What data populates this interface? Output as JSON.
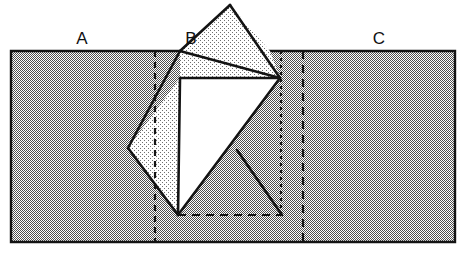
{
  "figure": {
    "canvas": {
      "width": 469,
      "height": 256,
      "background": "#ffffff"
    },
    "labels": [
      {
        "id": "A",
        "text": "A",
        "x": 82,
        "y": 44
      },
      {
        "id": "B",
        "text": "B",
        "x": 191,
        "y": 44
      },
      {
        "id": "C",
        "text": "C",
        "x": 379,
        "y": 44
      }
    ],
    "colors": {
      "strip_fill": "#9b9b9b",
      "flap_fill": "#cfcfcf",
      "white_fill": "#ffffff",
      "outline": "#141414",
      "label_color": "#111111",
      "dash_color": "#141414"
    },
    "strip": {
      "name": "background-rectangle",
      "points": "11,51 455,51 455,242 11,242",
      "top_y": 51,
      "bottom_y": 242,
      "left_x": 11,
      "right_x": 455
    },
    "square": {
      "name": "rotated-square",
      "vertices": {
        "top": {
          "x": 180,
          "y": 51
        },
        "right": {
          "x": 280,
          "y": 78
        },
        "bottom": {
          "x": 178,
          "y": 215
        },
        "left": {
          "x": 128,
          "y": 148
        }
      }
    },
    "shapes": {
      "top_triangle": {
        "name": "upper-flap-triangle",
        "points": "180,51 230,5 270,51",
        "fill": "flap_fill"
      },
      "upper_band": {
        "name": "upper-band-quad",
        "points": "180,51 270,51 280,78 180,78",
        "fill": "flap_fill"
      },
      "left_flap": {
        "name": "left-flap-polygon",
        "points": "180,78 180,215 128,148",
        "fill": "flap_fill"
      },
      "white_core": {
        "name": "white-inner-polygon",
        "points": "180,78 280,78 178,215",
        "fill": "white_fill"
      }
    },
    "lines": {
      "solid": [
        {
          "name": "square-edge-top-left",
          "x1": 180,
          "y1": 51,
          "x2": 128,
          "y2": 148
        },
        {
          "name": "square-edge-bottom-left",
          "x1": 128,
          "y1": 148,
          "x2": 178,
          "y2": 215
        },
        {
          "name": "square-edge-bottom-right",
          "x1": 178,
          "y1": 215,
          "x2": 280,
          "y2": 78
        },
        {
          "name": "square-edge-top-right",
          "x1": 280,
          "y1": 78,
          "x2": 180,
          "y2": 51
        },
        {
          "name": "triangle-edge-left",
          "x1": 180,
          "y1": 51,
          "x2": 230,
          "y2": 5
        },
        {
          "name": "triangle-edge-right",
          "x1": 230,
          "y1": 5,
          "x2": 280,
          "y2": 78
        },
        {
          "name": "crease-horizontal",
          "x1": 180,
          "y1": 78,
          "x2": 280,
          "y2": 78
        },
        {
          "name": "crease-vertical",
          "x1": 180,
          "y1": 78,
          "x2": 178,
          "y2": 215
        },
        {
          "name": "lower-right-flap-edge",
          "x1": 237,
          "y1": 150,
          "x2": 282,
          "y2": 215
        }
      ],
      "dashed": [
        {
          "name": "dashed-vertical-left",
          "x1": 155,
          "y1": 51,
          "x2": 155,
          "y2": 242,
          "pattern": "6,5"
        },
        {
          "name": "dashed-vertical-mid",
          "x1": 281,
          "y1": 51,
          "x2": 281,
          "y2": 215,
          "pattern": "3,4"
        },
        {
          "name": "dashed-vertical-right",
          "x1": 303,
          "y1": 51,
          "x2": 303,
          "y2": 242,
          "pattern": "8,6"
        },
        {
          "name": "dashed-horizontal-bottom",
          "x1": 178,
          "y1": 215,
          "x2": 282,
          "y2": 215,
          "pattern": "8,6"
        }
      ]
    }
  }
}
